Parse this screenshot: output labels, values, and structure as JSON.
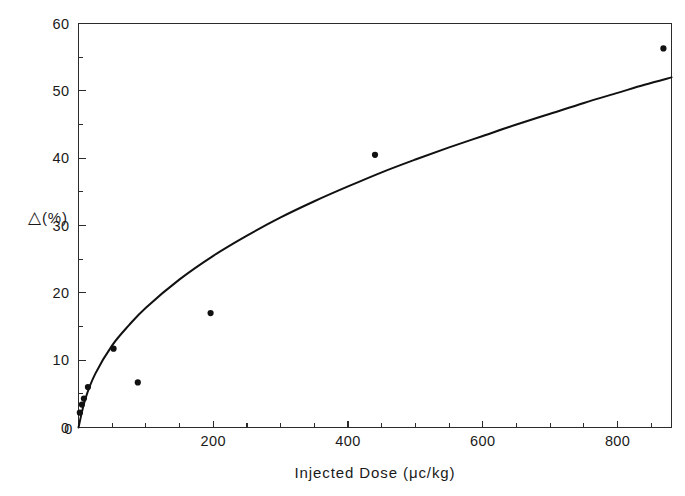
{
  "figure": {
    "background_color": "#ffffff",
    "ink_color": "#111111",
    "frame_color": "#2b2b2b"
  },
  "axes": {
    "y_title": "△(%)",
    "y_title_delta": "△",
    "y_title_unit": "(%)",
    "x_title": "Injected Dose (μc/kg)",
    "x_title_plain": "Injected Dose",
    "x_title_units": "(μc/kg)",
    "y_ticks_major": [
      0,
      10,
      20,
      30,
      40,
      50,
      60
    ],
    "y_ticks_minor": [
      5,
      15,
      25,
      35,
      45,
      55
    ],
    "y_tick_labels": [
      "0",
      "10",
      "20",
      "30",
      "40",
      "50",
      "60"
    ],
    "x_ticks_major": [
      0,
      200,
      400,
      600,
      800
    ],
    "x_tick_labels": [
      "0",
      "200",
      "400",
      "600",
      "800"
    ],
    "x_ticks_minor": [
      50,
      100,
      150,
      250,
      300,
      350,
      450,
      500,
      550,
      650,
      700,
      750,
      850
    ],
    "tick_direction": "inward",
    "grid": "off",
    "frame": "full-box"
  },
  "chart_data": {
    "type": "scatter",
    "title": "",
    "xlabel": "Injected Dose (μc/kg)",
    "ylabel": "Δ (%)",
    "xlim": [
      0,
      880
    ],
    "ylim": [
      0,
      60
    ],
    "grid": false,
    "legend": "none",
    "series": [
      {
        "name": "measured",
        "type": "scatter",
        "marker": "filled-circle",
        "points": [
          {
            "x": 2,
            "y": 2.2
          },
          {
            "x": 5,
            "y": 3.4
          },
          {
            "x": 8,
            "y": 4.3
          },
          {
            "x": 14,
            "y": 6.0
          },
          {
            "x": 52,
            "y": 11.7
          },
          {
            "x": 88,
            "y": 6.7
          },
          {
            "x": 196,
            "y": 17.0
          },
          {
            "x": 440,
            "y": 40.5
          },
          {
            "x": 868,
            "y": 56.3
          }
        ]
      },
      {
        "name": "fitted curve",
        "type": "line",
        "description": "saturating log-type fit through origin rising to ~55 at x=880",
        "points": [
          {
            "x": 0,
            "y": 0.0
          },
          {
            "x": 10,
            "y": 4.2
          },
          {
            "x": 25,
            "y": 8.0
          },
          {
            "x": 50,
            "y": 12.2
          },
          {
            "x": 75,
            "y": 15.2
          },
          {
            "x": 100,
            "y": 17.8
          },
          {
            "x": 150,
            "y": 22.0
          },
          {
            "x": 200,
            "y": 25.5
          },
          {
            "x": 250,
            "y": 28.5
          },
          {
            "x": 300,
            "y": 31.2
          },
          {
            "x": 350,
            "y": 33.6
          },
          {
            "x": 400,
            "y": 35.8
          },
          {
            "x": 450,
            "y": 37.9
          },
          {
            "x": 500,
            "y": 39.8
          },
          {
            "x": 550,
            "y": 41.6
          },
          {
            "x": 600,
            "y": 43.3
          },
          {
            "x": 650,
            "y": 45.0
          },
          {
            "x": 700,
            "y": 46.6
          },
          {
            "x": 750,
            "y": 48.2
          },
          {
            "x": 800,
            "y": 49.7
          },
          {
            "x": 840,
            "y": 50.9
          },
          {
            "x": 880,
            "y": 52.0
          }
        ]
      }
    ]
  }
}
